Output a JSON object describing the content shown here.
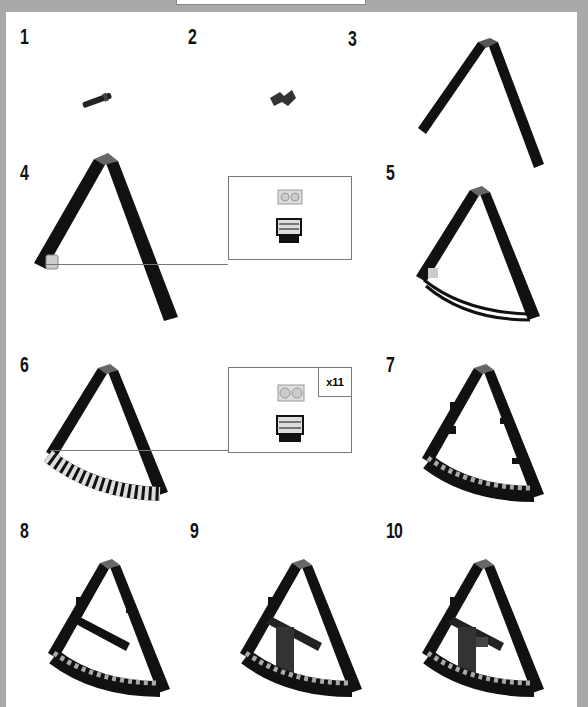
{
  "document": {
    "type": "building-instructions-page",
    "steps": [
      {
        "number": "1",
        "content": "small-pin-part"
      },
      {
        "number": "2",
        "content": "angle-bracket-part"
      },
      {
        "number": "3",
        "content": "two-beams-joined-at-top"
      },
      {
        "number": "4",
        "content": "frame-with-tile-attached",
        "callout": {
          "quantity": ""
        }
      },
      {
        "number": "5",
        "content": "frame-with-curved-rods"
      },
      {
        "number": "6",
        "content": "frame-with-curved-tile-row",
        "callout": {
          "quantity": "x11"
        }
      },
      {
        "number": "7",
        "content": "frame-with-side-clips"
      },
      {
        "number": "8",
        "content": "frame-with-crossbar"
      },
      {
        "number": "9",
        "content": "frame-with-vertical-support"
      },
      {
        "number": "10",
        "content": "frame-with-completed-support"
      }
    ]
  },
  "colors": {
    "background": "#a9a9a9",
    "page": "#ffffff",
    "part_dark": "#111111",
    "part_gray": "#888888",
    "part_light": "#d6d6d6"
  }
}
